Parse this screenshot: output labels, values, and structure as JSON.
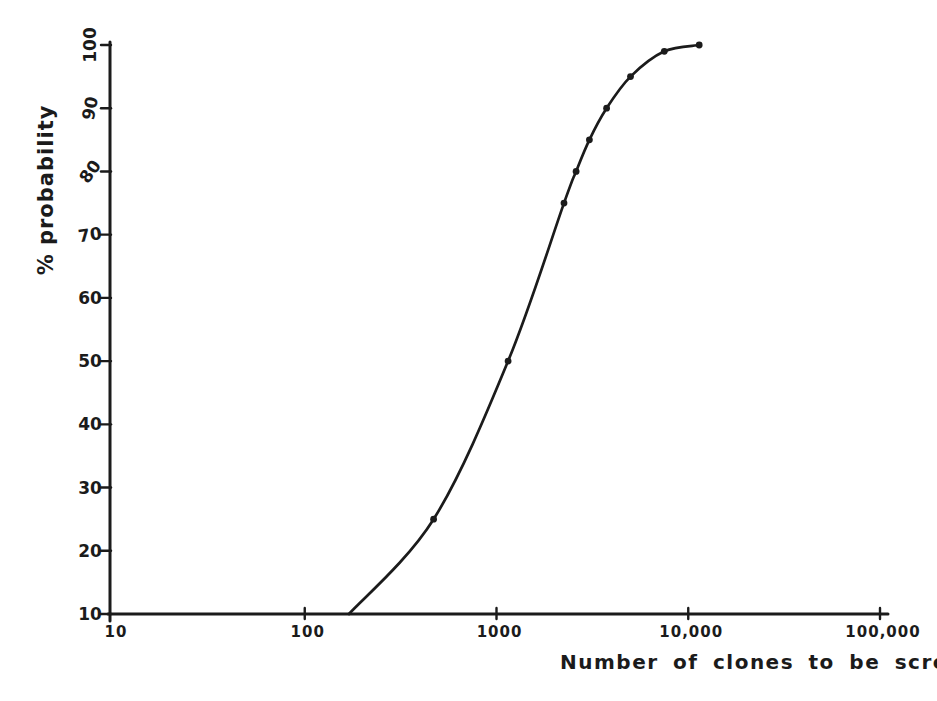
{
  "figure": {
    "background": "#ffffff",
    "ink_color": "#1b1b1b"
  },
  "chart_data": {
    "type": "line",
    "title": "",
    "xlabel": "Number of clones to be screened",
    "ylabel": "% probability",
    "x_scale": "log",
    "y_scale": "linear",
    "xlim": [
      10,
      100000
    ],
    "ylim": [
      10,
      100
    ],
    "grid": false,
    "legend": null,
    "x_ticks": [
      {
        "value": 10,
        "label": "10"
      },
      {
        "value": 100,
        "label": "100"
      },
      {
        "value": 1000,
        "label": "1000"
      },
      {
        "value": 10000,
        "label": "10,000"
      },
      {
        "value": 100000,
        "label": "100,000"
      }
    ],
    "y_ticks": [
      {
        "value": 10,
        "label": "10"
      },
      {
        "value": 20,
        "label": "20"
      },
      {
        "value": 30,
        "label": "30"
      },
      {
        "value": 40,
        "label": "40"
      },
      {
        "value": 50,
        "label": "50"
      },
      {
        "value": 60,
        "label": "60"
      },
      {
        "value": 70,
        "label": "70"
      },
      {
        "value": 80,
        "label": "80"
      },
      {
        "value": 90,
        "label": "90"
      },
      {
        "value": 100,
        "label": "100"
      }
    ],
    "series": [
      {
        "name": "screening-probability-curve",
        "points": [
          [
            170,
            10
          ],
          [
            470,
            25
          ],
          [
            1150,
            50
          ],
          [
            2250,
            75
          ],
          [
            2600,
            80
          ],
          [
            3050,
            85
          ],
          [
            3750,
            90
          ],
          [
            5000,
            95
          ],
          [
            7500,
            99
          ],
          [
            11400,
            100
          ]
        ],
        "marked_points": [
          [
            470,
            25
          ],
          [
            1150,
            50
          ],
          [
            2250,
            75
          ],
          [
            2600,
            80
          ],
          [
            3050,
            85
          ],
          [
            3750,
            90
          ],
          [
            5000,
            95
          ],
          [
            7500,
            99
          ],
          [
            11400,
            100
          ]
        ]
      }
    ]
  }
}
